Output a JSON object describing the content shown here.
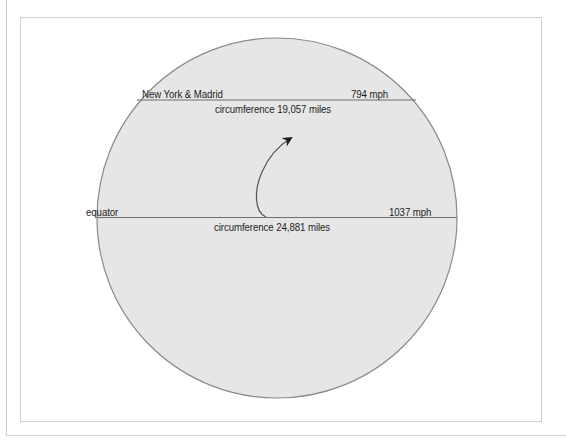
{
  "colors": {
    "sphere_fill": "#e6e6e6",
    "sphere_stroke": "#8a8a8a",
    "line": "#6e6e6e",
    "text": "#1e1e1e",
    "frame": "#cfcfcf",
    "arrow": "#1a1a1a"
  },
  "diagram": {
    "type": "earth-rotation-speed",
    "latitude_line": {
      "place_label": "New York & Madrid",
      "speed_label": "794 mph",
      "circumference_label": "circumference 19,057 miles"
    },
    "equator_line": {
      "place_label": "equator",
      "speed_label": "1037 mph",
      "circumference_label": "circumference 24,881 miles"
    },
    "arrow": {
      "meaning": "direction-of-rotation"
    }
  }
}
